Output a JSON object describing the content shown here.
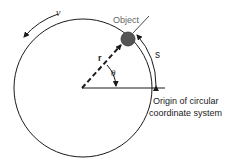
{
  "diagram": {
    "labels": {
      "object": "Object",
      "velocity": "v",
      "radius": "r",
      "angle": "θ",
      "arc_length": "s",
      "origin_line1": "Origin of circular",
      "origin_line2": "coordinate system"
    },
    "colors": {
      "line": "#1a1a1a",
      "object_fill": "#555555",
      "object_label": "#666666",
      "background": "#ffffff"
    }
  }
}
